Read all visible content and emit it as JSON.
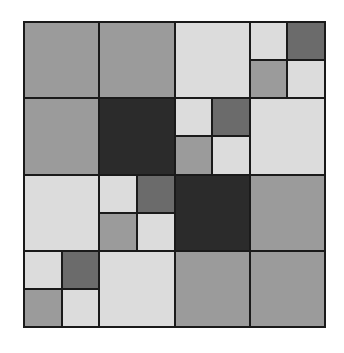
{
  "diagram": {
    "type": "quadtree-grid",
    "grid_size": [
      4,
      4
    ],
    "palette": {
      "line": "#1a1a1a",
      "mid": "#9b9b9b",
      "light": "#dcdcdc",
      "dark": "#6b6b6b",
      "black": "#2b2b2b"
    },
    "cells": [
      {
        "row": 0,
        "col": 0,
        "fill": "mid"
      },
      {
        "row": 0,
        "col": 1,
        "fill": "mid"
      },
      {
        "row": 0,
        "col": 2,
        "fill": "light"
      },
      {
        "row": 0,
        "col": 3,
        "sub": [
          "light",
          "dark",
          "mid",
          "light"
        ]
      },
      {
        "row": 1,
        "col": 0,
        "fill": "mid"
      },
      {
        "row": 1,
        "col": 1,
        "fill": "black"
      },
      {
        "row": 1,
        "col": 2,
        "sub": [
          "light",
          "dark",
          "mid",
          "light"
        ]
      },
      {
        "row": 1,
        "col": 3,
        "fill": "light"
      },
      {
        "row": 2,
        "col": 0,
        "fill": "light"
      },
      {
        "row": 2,
        "col": 1,
        "sub": [
          "light",
          "dark",
          "mid",
          "light"
        ]
      },
      {
        "row": 2,
        "col": 2,
        "fill": "black"
      },
      {
        "row": 2,
        "col": 3,
        "fill": "mid"
      },
      {
        "row": 3,
        "col": 0,
        "sub": [
          "light",
          "dark",
          "mid",
          "light"
        ]
      },
      {
        "row": 3,
        "col": 1,
        "fill": "light"
      },
      {
        "row": 3,
        "col": 2,
        "fill": "mid"
      },
      {
        "row": 3,
        "col": 3,
        "fill": "mid"
      }
    ]
  }
}
